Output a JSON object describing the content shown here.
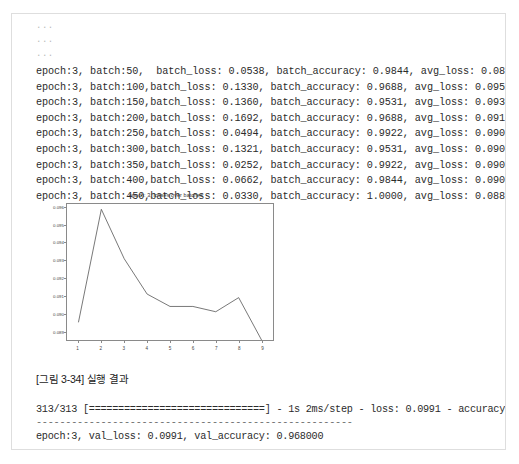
{
  "page": {
    "ellipsis_lines": [
      "...",
      "...",
      "..."
    ],
    "caption": "[그림 3-34] 실행 결과"
  },
  "training_log": {
    "lines": [
      "epoch:3, batch:50,  batch_loss: 0.0538, batch_accuracy: 0.9844, avg_loss: 0.0895",
      "epoch:3, batch:100,batch_loss: 0.1330, batch_accuracy: 0.9688, avg_loss: 0.0959",
      "epoch:3, batch:150,batch_loss: 0.1360, batch_accuracy: 0.9531, avg_loss: 0.0931",
      "epoch:3, batch:200,batch_loss: 0.1692, batch_accuracy: 0.9688, avg_loss: 0.0911",
      "epoch:3, batch:250,batch_loss: 0.0494, batch_accuracy: 0.9922, avg_loss: 0.0904",
      "epoch:3, batch:300,batch_loss: 0.1321, batch_accuracy: 0.9531, avg_loss: 0.0904",
      "epoch:3, batch:350,batch_loss: 0.0252, batch_accuracy: 0.9922, avg_loss: 0.0901",
      "epoch:3, batch:400,batch_loss: 0.0662, batch_accuracy: 0.9844, avg_loss: 0.0909",
      "epoch:3, batch:450,batch_loss: 0.0330, batch_accuracy: 1.0000, avg_loss: 0.0885"
    ]
  },
  "evaluation": {
    "progress_line": "313/313 [==============================] - 1s 2ms/step - loss: 0.0991 - accuracy: 0.9680",
    "separator": "------------------------------------------------------",
    "summary_line": "epoch:3, val_loss: 0.0991, val_accuracy: 0.968000"
  },
  "chart_data": {
    "type": "line",
    "title": "epoch: 3, losses over batches",
    "xlabel": "",
    "ylabel": "",
    "x": [
      1,
      2,
      3,
      4,
      5,
      6,
      7,
      8,
      9
    ],
    "values": [
      0.0895,
      0.0959,
      0.0931,
      0.0911,
      0.0904,
      0.0904,
      0.0901,
      0.0909,
      0.0885
    ],
    "xticks": [
      "1",
      "2",
      "3",
      "4",
      "5",
      "6",
      "7",
      "8",
      "9"
    ],
    "yticks": [
      "0.096",
      "0.095",
      "0.094",
      "0.093",
      "0.092",
      "0.091",
      "0.090",
      "0.089"
    ],
    "ytick_values": [
      0.096,
      0.095,
      0.094,
      0.093,
      0.092,
      0.091,
      0.09,
      0.089
    ],
    "xlim": [
      0.5,
      9.5
    ],
    "ylim": [
      0.0885,
      0.0962
    ],
    "grid": false,
    "legend": false,
    "line_color": "#555555"
  }
}
